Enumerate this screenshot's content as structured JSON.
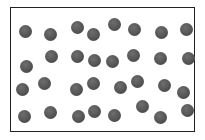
{
  "diagram": {
    "type": "particle-box",
    "box": {
      "x": 10,
      "y": 7,
      "width": 185,
      "height": 125
    },
    "particle_color": "#555555",
    "particle_diameter": 13,
    "particles": [
      {
        "x": 25,
        "y": 31
      },
      {
        "x": 50,
        "y": 34
      },
      {
        "x": 77,
        "y": 27
      },
      {
        "x": 93,
        "y": 34
      },
      {
        "x": 114,
        "y": 24
      },
      {
        "x": 134,
        "y": 29
      },
      {
        "x": 161,
        "y": 32
      },
      {
        "x": 186,
        "y": 29
      },
      {
        "x": 26,
        "y": 66
      },
      {
        "x": 51,
        "y": 56
      },
      {
        "x": 77,
        "y": 56
      },
      {
        "x": 94,
        "y": 60
      },
      {
        "x": 112,
        "y": 61
      },
      {
        "x": 133,
        "y": 55
      },
      {
        "x": 160,
        "y": 58
      },
      {
        "x": 188,
        "y": 58
      },
      {
        "x": 22,
        "y": 89
      },
      {
        "x": 44,
        "y": 83
      },
      {
        "x": 76,
        "y": 89
      },
      {
        "x": 93,
        "y": 83
      },
      {
        "x": 120,
        "y": 87
      },
      {
        "x": 137,
        "y": 81
      },
      {
        "x": 164,
        "y": 85
      },
      {
        "x": 183,
        "y": 92
      },
      {
        "x": 24,
        "y": 116
      },
      {
        "x": 50,
        "y": 112
      },
      {
        "x": 78,
        "y": 116
      },
      {
        "x": 94,
        "y": 111
      },
      {
        "x": 114,
        "y": 115
      },
      {
        "x": 142,
        "y": 106
      },
      {
        "x": 160,
        "y": 117
      },
      {
        "x": 187,
        "y": 110
      }
    ],
    "particle_count": 32
  }
}
